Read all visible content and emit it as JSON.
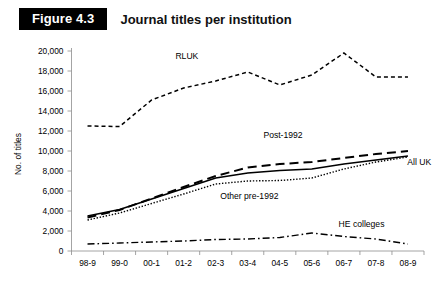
{
  "header": {
    "figure_badge": "Figure 4.3",
    "title": "Journal titles per institution"
  },
  "chart_data": {
    "type": "line",
    "title": "Journal titles per institution",
    "xlabel": "",
    "ylabel": "No. of titles",
    "categories": [
      "98-9",
      "99-0",
      "00-1",
      "01-2",
      "02-3",
      "03-4",
      "04-5",
      "05-6",
      "06-7",
      "07-8",
      "08-9"
    ],
    "ylim": [
      0,
      20000
    ],
    "ytick_values": [
      0,
      2000,
      4000,
      6000,
      8000,
      10000,
      12000,
      14000,
      16000,
      18000,
      20000
    ],
    "ytick_labels": [
      "0",
      "2,000",
      "4,000",
      "6,000",
      "8,000",
      "10,000",
      "12,000",
      "14,000",
      "16,000",
      "18,000",
      "20,000"
    ],
    "grid": false,
    "legend": "inline-labels",
    "series": [
      {
        "name": "RLUK",
        "style": "dashed",
        "label_x_index": 3.1,
        "label_y": 19200,
        "values": [
          12500,
          12450,
          15100,
          16300,
          17000,
          17900,
          16600,
          17600,
          19800,
          17400,
          17400
        ]
      },
      {
        "name": "Post-1992",
        "style": "long-dash",
        "label_x_index": 6.1,
        "label_y": 11300,
        "values": [
          3350,
          4100,
          5250,
          6400,
          7500,
          8350,
          8700,
          8900,
          9300,
          9700,
          10000
        ]
      },
      {
        "name": "All UK",
        "style": "solid",
        "label_x_index": 10.35,
        "label_y": 8600,
        "values": [
          3500,
          4150,
          5200,
          6250,
          7300,
          7800,
          8050,
          8200,
          8700,
          9100,
          9500
        ]
      },
      {
        "name": "Other pre-1992",
        "style": "dotted",
        "label_x_index": 5.05,
        "label_y": 5200,
        "values": [
          3100,
          3800,
          4750,
          5700,
          6700,
          7000,
          7050,
          7300,
          8200,
          8900,
          9400
        ]
      },
      {
        "name": "HE colleges",
        "style": "dash-dot",
        "label_x_index": 8.55,
        "label_y": 2450,
        "values": [
          700,
          800,
          900,
          1000,
          1150,
          1200,
          1350,
          1800,
          1450,
          1200,
          700
        ]
      }
    ]
  }
}
